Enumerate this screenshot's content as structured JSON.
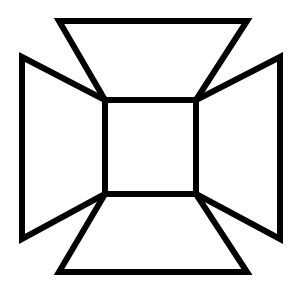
{
  "figure": {
    "stroke_color": "#000000",
    "background_color": "#ffffff",
    "stroke_width": 6,
    "shapes": {
      "center_square": [
        [
          105,
          100
        ],
        [
          196,
          100
        ],
        [
          196,
          194
        ],
        [
          105,
          194
        ]
      ],
      "top_trapezoid": [
        [
          59,
          21
        ],
        [
          247,
          21
        ],
        [
          196,
          100
        ],
        [
          105,
          100
        ]
      ],
      "bottom_trapezoid": [
        [
          105,
          194
        ],
        [
          196,
          194
        ],
        [
          247,
          272
        ],
        [
          59,
          272
        ]
      ],
      "left_trapezoid": [
        [
          22,
          57
        ],
        [
          105,
          100
        ],
        [
          105,
          194
        ],
        [
          22,
          239
        ]
      ],
      "right_trapezoid": [
        [
          280,
          57
        ],
        [
          280,
          239
        ],
        [
          196,
          194
        ],
        [
          196,
          100
        ]
      ]
    }
  }
}
